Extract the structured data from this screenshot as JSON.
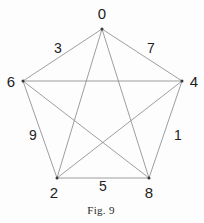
{
  "figure": {
    "caption": "Fig. 9",
    "caption_x": 101,
    "caption_y": 210,
    "background_color": "#fdfdfd",
    "edge_color": "#8d8d8d",
    "vertex_dot_color": "#3a3a3a",
    "text_color": "#1d1d1d"
  },
  "chart_data": {
    "type": "diagram",
    "subtype": "complete-graph-K5",
    "title": "Fig. 9",
    "vertices": [
      {
        "id": "v0",
        "label": "0",
        "x": 102,
        "y": 29,
        "label_x": 102,
        "label_y": 13
      },
      {
        "id": "v4",
        "label": "4",
        "x": 182,
        "y": 81,
        "label_x": 194,
        "label_y": 81
      },
      {
        "id": "v8",
        "label": "8",
        "x": 149,
        "y": 178,
        "label_x": 149,
        "label_y": 192
      },
      {
        "id": "v2",
        "label": "2",
        "x": 57,
        "y": 178,
        "label_x": 54,
        "label_y": 192
      },
      {
        "id": "v6",
        "label": "6",
        "x": 23,
        "y": 81,
        "label_x": 11,
        "label_y": 81
      }
    ],
    "edges": [
      {
        "from": "v0",
        "to": "v4",
        "kind": "side"
      },
      {
        "from": "v4",
        "to": "v8",
        "kind": "side"
      },
      {
        "from": "v8",
        "to": "v2",
        "kind": "side"
      },
      {
        "from": "v2",
        "to": "v6",
        "kind": "side"
      },
      {
        "from": "v6",
        "to": "v0",
        "kind": "side"
      },
      {
        "from": "v0",
        "to": "v8",
        "kind": "diagonal"
      },
      {
        "from": "v0",
        "to": "v2",
        "kind": "diagonal"
      },
      {
        "from": "v4",
        "to": "v2",
        "kind": "diagonal"
      },
      {
        "from": "v4",
        "to": "v6",
        "kind": "diagonal"
      },
      {
        "from": "v8",
        "to": "v6",
        "kind": "diagonal"
      }
    ],
    "edge_labels": [
      {
        "id": "e3",
        "label": "3",
        "x": 58,
        "y": 48,
        "edge": "v6-v0"
      },
      {
        "id": "e7",
        "label": "7",
        "x": 151,
        "y": 48,
        "edge": "v0-v4"
      },
      {
        "id": "e9",
        "label": "9",
        "x": 33,
        "y": 135,
        "edge": "v6-v2"
      },
      {
        "id": "e1",
        "label": "1",
        "x": 178,
        "y": 135,
        "edge": "v4-v8"
      },
      {
        "id": "e5",
        "label": "5",
        "x": 103,
        "y": 186,
        "edge": "v2-v8"
      }
    ],
    "vertex_labels": [
      "0",
      "4",
      "8",
      "2",
      "6"
    ],
    "edge_label_values": [
      "3",
      "7",
      "9",
      "1",
      "5"
    ]
  }
}
